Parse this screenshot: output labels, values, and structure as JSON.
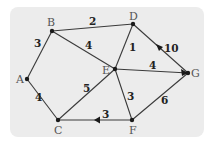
{
  "diagram": {
    "type": "weighted-graph",
    "nodes": [
      {
        "id": "A",
        "label": "A",
        "x": 27,
        "y": 79
      },
      {
        "id": "B",
        "label": "B",
        "x": 52,
        "y": 31
      },
      {
        "id": "C",
        "label": "C",
        "x": 58,
        "y": 120
      },
      {
        "id": "D",
        "label": "D",
        "x": 133,
        "y": 24
      },
      {
        "id": "E",
        "label": "E",
        "x": 115,
        "y": 69
      },
      {
        "id": "F",
        "label": "F",
        "x": 132,
        "y": 120
      },
      {
        "id": "G",
        "label": "G",
        "x": 188,
        "y": 73
      }
    ],
    "edges": [
      {
        "from": "A",
        "to": "B",
        "weight": "3",
        "directed": false
      },
      {
        "from": "B",
        "to": "D",
        "weight": "2",
        "directed": false
      },
      {
        "from": "B",
        "to": "E",
        "weight": "4",
        "directed": false
      },
      {
        "from": "A",
        "to": "C",
        "weight": "4",
        "directed": false
      },
      {
        "from": "C",
        "to": "E",
        "weight": "5",
        "directed": false
      },
      {
        "from": "E",
        "to": "D",
        "weight": "1",
        "directed": false
      },
      {
        "from": "E",
        "to": "G",
        "weight": "4",
        "directed": false
      },
      {
        "from": "E",
        "to": "F",
        "weight": "3",
        "directed": false
      },
      {
        "from": "G",
        "to": "D",
        "weight": "10",
        "directed": true
      },
      {
        "from": "F",
        "to": "C",
        "weight": "3",
        "directed": true
      },
      {
        "from": "F",
        "to": "G",
        "weight": "6",
        "directed": false
      }
    ],
    "labels": {
      "A": "A",
      "B": "B",
      "C": "C",
      "D": "D",
      "E": "E",
      "F": "F",
      "G": "G",
      "w_AB": "3",
      "w_BD": "2",
      "w_BE": "4",
      "w_AC": "4",
      "w_CE": "5",
      "w_ED": "1",
      "w_EG": "4",
      "w_EF": "3",
      "w_GD": "10",
      "w_FC": "3",
      "w_FG": "6"
    },
    "colors": {
      "background": "#ececec",
      "edge": "#3a3a3a",
      "node": "#1a1a1a"
    }
  }
}
